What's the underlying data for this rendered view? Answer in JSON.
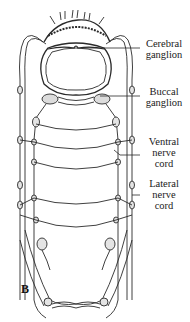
{
  "figure": {
    "panel_letter": "B",
    "line_color": "#2a2a2a",
    "background": "#ffffff"
  },
  "labels": [
    {
      "id": "cerebral",
      "line1": "Cerebral",
      "line2": "ganglion",
      "line3": ""
    },
    {
      "id": "buccal",
      "line1": "Buccal",
      "line2": "ganglion",
      "line3": ""
    },
    {
      "id": "ventral",
      "line1": "Ventral",
      "line2": "nerve",
      "line3": "cord"
    },
    {
      "id": "lateral",
      "line1": "Lateral",
      "line2": "nerve",
      "line3": "cord"
    }
  ]
}
